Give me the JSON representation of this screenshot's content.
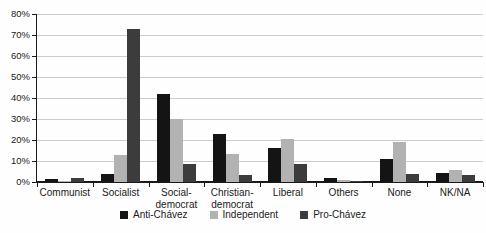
{
  "chart_data": {
    "type": "bar",
    "title": "",
    "xlabel": "",
    "ylabel": "",
    "categories": [
      "Communist",
      "Socialist",
      "Social-\ndemocrat",
      "Christian-\ndemocrat",
      "Liberal",
      "Others",
      "None",
      "NK/NA"
    ],
    "series": [
      {
        "name": "Anti-Chávez",
        "color": "#141414",
        "values": [
          1.5,
          4,
          42,
          23,
          16,
          2,
          11,
          4.5
        ]
      },
      {
        "name": "Independent",
        "color": "#b2b2b2",
        "values": [
          0.5,
          13,
          30,
          13.5,
          20.5,
          1,
          19,
          5.5
        ]
      },
      {
        "name": "Pro-Chávez",
        "color": "#3c3c3c",
        "values": [
          2,
          73,
          8.5,
          3.5,
          8.5,
          0.5,
          4,
          3.5
        ]
      }
    ],
    "ylim": [
      0,
      80
    ],
    "ytick_step": 10,
    "ytick_labels": [
      "0%",
      "10%",
      "20%",
      "30%",
      "40%",
      "50%",
      "60%",
      "70%",
      "80%"
    ],
    "grid": "horizontal",
    "legend_position": "bottom"
  },
  "colors": {
    "background": "#fefefe",
    "gridline": "#cccccc",
    "axis": "#1a1a1a",
    "text": "#1a1a1a"
  }
}
